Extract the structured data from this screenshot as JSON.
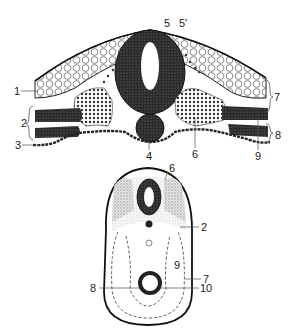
{
  "figure": {
    "top_section": {
      "description": "Transverse section of embryo dorsal region",
      "labels": [
        {
          "id": "1",
          "text": "1",
          "x": 14,
          "y": 86
        },
        {
          "id": "2",
          "text": "2",
          "x": 21,
          "y": 118
        },
        {
          "id": "3",
          "text": "3",
          "x": 15,
          "y": 141
        },
        {
          "id": "4",
          "text": "4",
          "x": 146,
          "y": 151
        },
        {
          "id": "5",
          "text": "5",
          "x": 164,
          "y": 18
        },
        {
          "id": "5p",
          "text": "5'",
          "x": 179,
          "y": 18
        },
        {
          "id": "6",
          "text": "6",
          "x": 192,
          "y": 149
        },
        {
          "id": "7",
          "text": "7",
          "x": 272,
          "y": 93
        },
        {
          "id": "8",
          "text": "8",
          "x": 273,
          "y": 131
        },
        {
          "id": "9",
          "text": "9",
          "x": 255,
          "y": 150
        }
      ]
    },
    "bottom_section": {
      "description": "Schematic cross section",
      "labels": [
        {
          "id": "6",
          "text": "6",
          "x": 169,
          "y": 168
        },
        {
          "id": "2",
          "text": "2",
          "x": 201,
          "y": 223
        },
        {
          "id": "9",
          "text": "9",
          "x": 174,
          "y": 260
        },
        {
          "id": "7",
          "text": "7",
          "x": 203,
          "y": 276
        },
        {
          "id": "8",
          "text": "8",
          "x": 92,
          "y": 284
        },
        {
          "id": "10",
          "text": "10",
          "x": 200,
          "y": 284
        }
      ]
    },
    "colors": {
      "ink": "#1a1a1a",
      "stipple": "#9a9a9a",
      "light_stipple": "#d8d8d8"
    }
  }
}
